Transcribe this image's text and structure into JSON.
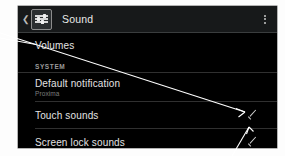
{
  "screen": {
    "background_color": "#000000",
    "actionbar": {
      "back_icon": "chevron-left-icon",
      "app_icon": "sound-sliders-icon",
      "title": "Sound",
      "overflow_icon": "overflow-menu-icon",
      "background_color": "#17191a",
      "title_color": "#e9e9e9"
    },
    "list": {
      "rows": [
        {
          "title": "Volumes",
          "subtitle": "",
          "checked": false,
          "type": "item"
        }
      ],
      "section": {
        "label": "SYSTEM",
        "rows": [
          {
            "title": "Default notification",
            "subtitle": "Proxima",
            "checked": false,
            "type": "item"
          },
          {
            "title": "Touch sounds",
            "subtitle": "",
            "checked": true,
            "type": "checkbox"
          },
          {
            "title": "Screen lock sounds",
            "subtitle": "",
            "checked": true,
            "type": "checkbox"
          }
        ]
      },
      "divider_color": "#303030",
      "title_color": "#e3e3e3",
      "subtitle_color": "#7e7e7e"
    }
  },
  "annotations": {
    "color": "#ffffff",
    "arrows": [
      {
        "name": "arrow-to-volumes",
        "target": "Volumes"
      },
      {
        "name": "arrow-to-touch-sounds-checkbox",
        "target": "Touch sounds"
      },
      {
        "name": "arrow-to-screen-lock-sounds-checkbox",
        "target": "Screen lock sounds"
      }
    ]
  },
  "page": {
    "background_color": "#ffffff"
  }
}
